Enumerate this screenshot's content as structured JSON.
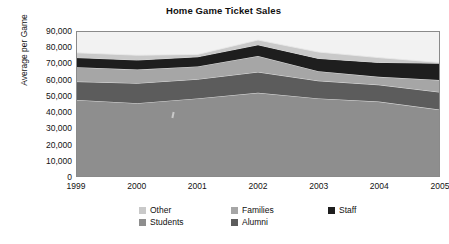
{
  "chart_data": {
    "type": "area",
    "title": "Home Game Ticket Sales",
    "xlabel": "",
    "ylabel": "Average per Game",
    "stacked": true,
    "grid": false,
    "legend_position": "bottom",
    "categories": [
      "1999",
      "2000",
      "2001",
      "2002",
      "2003",
      "2004",
      "2005"
    ],
    "x": [
      1999,
      2000,
      2001,
      2002,
      2003,
      2004,
      2005
    ],
    "ylim": [
      0,
      90000
    ],
    "yticks": [
      0,
      10000,
      20000,
      30000,
      40000,
      50000,
      60000,
      70000,
      80000,
      90000
    ],
    "ytick_labels": [
      "0",
      "10,000",
      "20,000",
      "30,000",
      "40,000",
      "50,000",
      "60,000",
      "70,000",
      "80,000",
      "90,000"
    ],
    "series": [
      {
        "name": "Students",
        "color": "#8e8e8e",
        "stack_order": 1,
        "values": [
          47500,
          45500,
          48500,
          52000,
          48500,
          46500,
          41500
        ],
        "cumulative": [
          47500,
          45500,
          48500,
          52000,
          48500,
          46500,
          41500
        ]
      },
      {
        "name": "Alumni",
        "color": "#5c5c5c",
        "stack_order": 2,
        "values": [
          11500,
          12500,
          12000,
          13000,
          11000,
          10500,
          11000
        ],
        "cumulative": [
          59000,
          58000,
          60500,
          65000,
          59500,
          57000,
          52500
        ]
      },
      {
        "name": "Families",
        "color": "#a6a6a6",
        "stack_order": 3,
        "values": [
          9000,
          8500,
          8000,
          10000,
          6000,
          5000,
          7500
        ],
        "cumulative": [
          68000,
          66500,
          68500,
          75000,
          65500,
          62000,
          60000
        ]
      },
      {
        "name": "Staff",
        "color": "#1e1e1e",
        "stack_order": 4,
        "values": [
          6000,
          6000,
          6000,
          7000,
          8000,
          9000,
          10500
        ],
        "cumulative": [
          74000,
          72500,
          74500,
          82000,
          73500,
          71000,
          70500
        ]
      },
      {
        "name": "Other",
        "color": "#c9c9c9",
        "stack_order": 5,
        "values": [
          3000,
          3000,
          1500,
          3000,
          4000,
          3000,
          500
        ],
        "cumulative": [
          77000,
          75500,
          76000,
          85000,
          77500,
          74000,
          71000
        ]
      }
    ],
    "totals": [
      77000,
      75500,
      76000,
      85000,
      77500,
      74000,
      71000
    ],
    "plot_background": "#f2f2f2"
  },
  "legend": {
    "items": [
      {
        "label": "Other",
        "color": "#c9c9c9"
      },
      {
        "label": "Families",
        "color": "#a6a6a6"
      },
      {
        "label": "Staff",
        "color": "#1e1e1e"
      },
      {
        "label": "Students",
        "color": "#8e8e8e"
      },
      {
        "label": "Alumni",
        "color": "#5c5c5c"
      }
    ]
  }
}
